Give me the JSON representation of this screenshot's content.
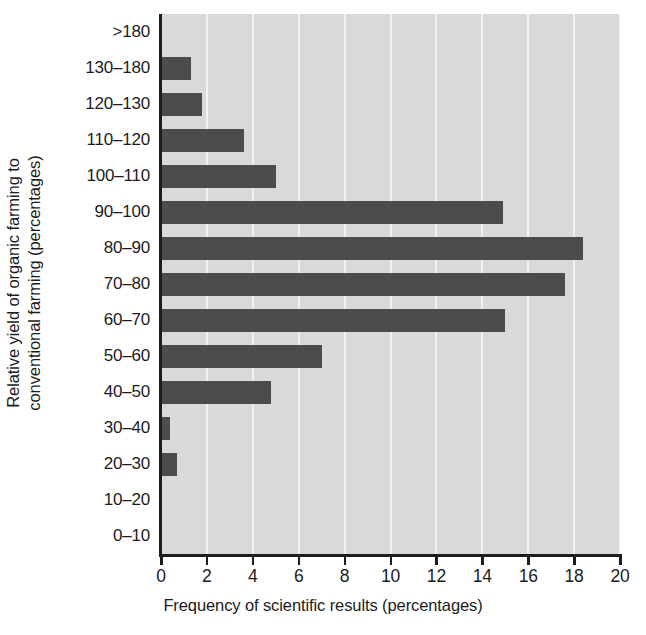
{
  "chart_data": {
    "type": "bar",
    "orientation": "horizontal",
    "title": "",
    "xlabel": "Frequency of scientific results (percentages)",
    "ylabel": "Relative yield of organic farming to conventional farming (percentages)",
    "ylabel_line1": "Relative yield of organic farming to",
    "ylabel_line2": "conventional farming (percentages)",
    "categories": [
      ">180",
      "130–180",
      "120–130",
      "110–120",
      "100–110",
      "90–100",
      "80–90",
      "70–80",
      "60–70",
      "50–60",
      "40–50",
      "30–40",
      "20–30",
      "10–20",
      "0–10"
    ],
    "values": [
      0,
      1.3,
      1.8,
      3.6,
      5.0,
      14.9,
      18.4,
      17.6,
      15.0,
      7.0,
      4.8,
      0.4,
      0.7,
      0,
      0
    ],
    "xlim": [
      0,
      20
    ],
    "xticks": [
      0,
      2,
      4,
      6,
      8,
      10,
      12,
      14,
      16,
      18,
      20
    ],
    "xtick_labels": [
      "0",
      "2",
      "4",
      "6",
      "8",
      "10",
      "12",
      "14",
      "16",
      "18",
      "20"
    ],
    "grid": "vertical",
    "legend": "none",
    "colors": {
      "bar": "#4c4c4c",
      "plot_background": "#d9d9d9",
      "gridline": "#f2f2f2",
      "axis": "#1c1c1c",
      "text": "#1c1c1c"
    }
  }
}
